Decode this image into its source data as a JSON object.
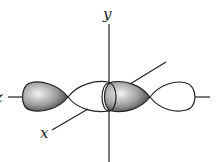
{
  "diagram": {
    "axes": {
      "y": {
        "label": "y"
      },
      "x": {
        "label": "x"
      },
      "z": {
        "label": "z"
      }
    },
    "colors": {
      "line": "#222222",
      "shaded_lobe_light": "#f2f2f2",
      "shaded_lobe_dark": "#3a3a3a",
      "unshaded_lobe": "#ffffff"
    },
    "orbitals": [
      {
        "name": "left-p-orbital",
        "shaded_lobe": "left",
        "unshaded_lobe": "right"
      },
      {
        "name": "right-p-orbital",
        "shaded_lobe": "left",
        "unshaded_lobe": "right"
      }
    ]
  }
}
